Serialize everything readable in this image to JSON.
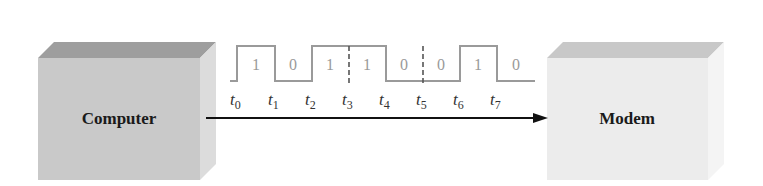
{
  "diagram": {
    "source_box": {
      "label": "Computer",
      "front_color": "#c9c9c9",
      "top_color": "#9e9e9e",
      "side_color": "#dcdcdc"
    },
    "target_box": {
      "label": "Modem",
      "front_color": "#ececec",
      "top_color": "#c8c8c8",
      "side_color": "#f4f4f4"
    },
    "arrow": {
      "from": "Computer",
      "to": "Modem",
      "color": "#111111"
    },
    "waveform": {
      "bits": [
        "1",
        "0",
        "1",
        "1",
        "0",
        "0",
        "1",
        "0"
      ],
      "time_labels": [
        {
          "base": "t",
          "sub": "0"
        },
        {
          "base": "t",
          "sub": "1"
        },
        {
          "base": "t",
          "sub": "2"
        },
        {
          "base": "t",
          "sub": "3"
        },
        {
          "base": "t",
          "sub": "4"
        },
        {
          "base": "t",
          "sub": "5"
        },
        {
          "base": "t",
          "sub": "6"
        },
        {
          "base": "t",
          "sub": "7"
        }
      ],
      "dashed_boundaries_at": [
        "t3",
        "t5"
      ],
      "line_color": "#9a9a9a"
    }
  }
}
